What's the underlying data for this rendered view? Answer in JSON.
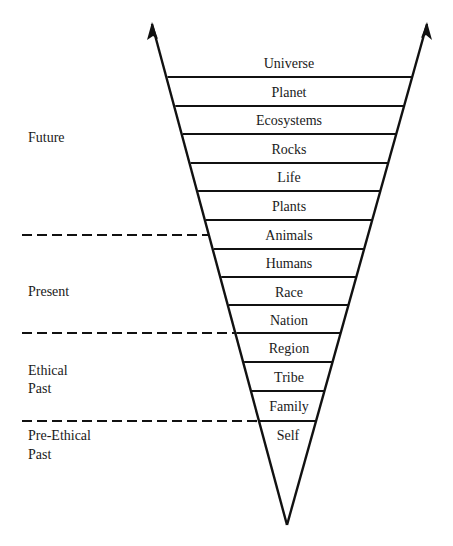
{
  "diagram": {
    "type": "inverted-funnel",
    "line_color": "#111111",
    "bands": [
      {
        "label": "Universe"
      },
      {
        "label": "Planet"
      },
      {
        "label": "Ecosystems"
      },
      {
        "label": "Rocks"
      },
      {
        "label": "Life"
      },
      {
        "label": "Plants"
      },
      {
        "label": "Animals"
      },
      {
        "label": "Humans"
      },
      {
        "label": "Race"
      },
      {
        "label": "Nation"
      },
      {
        "label": "Region"
      },
      {
        "label": "Tribe"
      },
      {
        "label": "Family"
      },
      {
        "label": "Self"
      }
    ],
    "eras": [
      {
        "lines": [
          "Future"
        ]
      },
      {
        "lines": [
          "Present"
        ]
      },
      {
        "lines": [
          "Ethical",
          "Past"
        ]
      },
      {
        "lines": [
          "Pre-Ethical",
          "Past"
        ]
      }
    ]
  }
}
